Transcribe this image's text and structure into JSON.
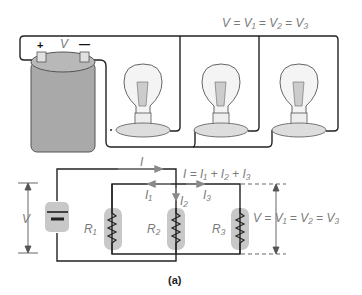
{
  "figure": {
    "caption": "(a)",
    "pictorial": {
      "equation": "V = V₁ = V₂ = V₃",
      "battery": {
        "plus": "+",
        "minus": "—",
        "label": "V"
      },
      "bulbs": 3
    },
    "schematic": {
      "current_total": "I",
      "current_equation": "I = I₁ + I₂ + I₃",
      "branch_currents": [
        "I₁",
        "I₂",
        "I₃"
      ],
      "resistors": [
        "R₁",
        "R₂",
        "R₃"
      ],
      "source_voltage_label": "V",
      "voltage_equation": "V = V₁ = V₂ = V₃"
    }
  },
  "colors": {
    "wire": "#222222",
    "highlight": "#c8c8c8",
    "label": "#7a7a7a",
    "arrow": "#8a8a8a",
    "battery_body": "#a9a9a9"
  }
}
